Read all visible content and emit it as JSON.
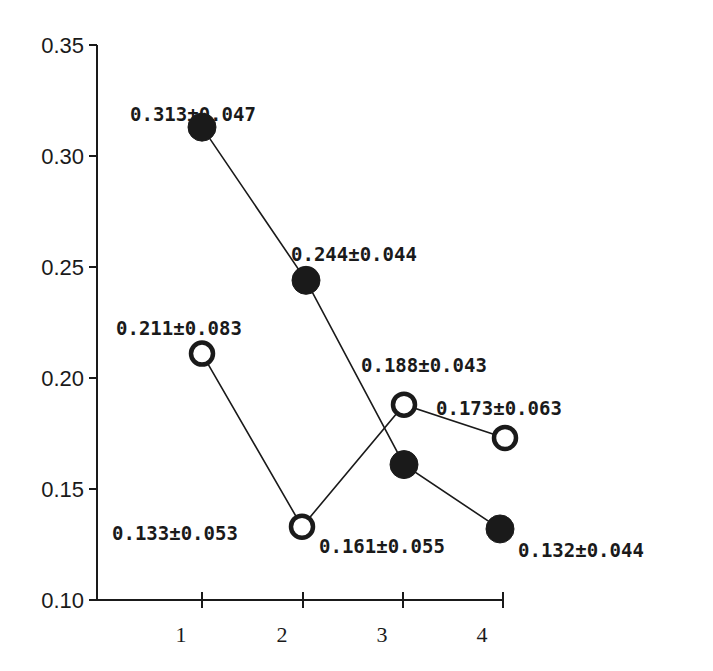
{
  "chart_data": {
    "type": "line",
    "title": "",
    "xlabel": "",
    "ylabel": "",
    "x": [
      1,
      2,
      3,
      4
    ],
    "categories": [
      "1",
      "2",
      "3",
      "4"
    ],
    "ylim": [
      0.1,
      0.35
    ],
    "yticks": [
      "0.10",
      "0.15",
      "0.20",
      "0.25",
      "0.30",
      "0.35"
    ],
    "grid": false,
    "legend": null,
    "series": [
      {
        "name": "filled",
        "marker": "filled-circle",
        "values": [
          0.313,
          0.244,
          0.161,
          0.132
        ],
        "errors": [
          0.047,
          0.044,
          0.055,
          0.044
        ],
        "labels": [
          "0.313±0.047",
          "0.244±0.044",
          "0.161±0.055",
          "0.132±0.044"
        ]
      },
      {
        "name": "open",
        "marker": "open-circle",
        "values": [
          0.211,
          0.133,
          0.188,
          0.173
        ],
        "errors": [
          0.083,
          0.053,
          0.043,
          0.063
        ],
        "labels": [
          "0.211±0.083",
          "0.133±0.053",
          "0.188±0.043",
          "0.173±0.063"
        ]
      }
    ]
  },
  "layout": {
    "ink_color": "#1a1a1a",
    "background": "#ffffff"
  }
}
